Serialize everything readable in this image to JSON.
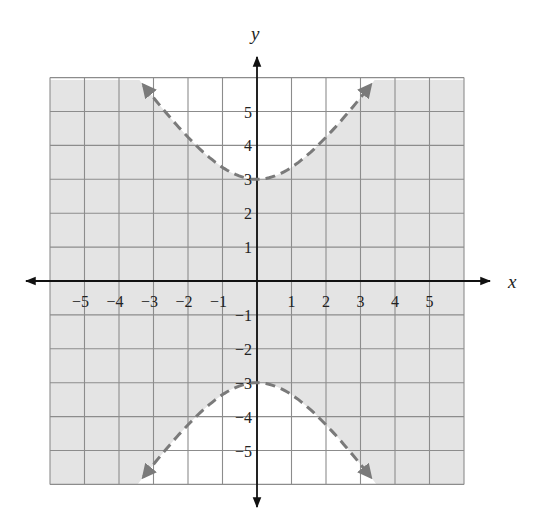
{
  "chart_data": {
    "type": "line",
    "title": "",
    "xlabel": "x",
    "ylabel": "y",
    "xlim": [
      -6,
      6
    ],
    "ylim": [
      -6,
      6
    ],
    "grid": true,
    "x_tick_labels": [
      "−5",
      "−4",
      "−3",
      "−2",
      "−1",
      "1",
      "2",
      "3",
      "4",
      "5"
    ],
    "x_ticks": [
      -5,
      -4,
      -3,
      -2,
      -1,
      1,
      2,
      3,
      4,
      5
    ],
    "y_tick_labels": [
      "5",
      "4",
      "3",
      "2",
      "1",
      "−1",
      "−2",
      "−3",
      "−4",
      "−5"
    ],
    "y_ticks": [
      5,
      4,
      3,
      2,
      1,
      -1,
      -2,
      -3,
      -4,
      -5
    ],
    "boundary": {
      "equation": "y^2/9 - x^2/4 = 1",
      "style": "dashed",
      "vertices": [
        [
          0,
          3
        ],
        [
          0,
          -3
        ]
      ],
      "a": 3,
      "b": 2,
      "series": [
        {
          "name": "upper branch",
          "x": [
            -3.46,
            -3,
            -2,
            -1,
            0,
            1,
            2,
            3,
            3.46
          ],
          "y": [
            6,
            5.41,
            4.24,
            3.35,
            3,
            3.35,
            4.24,
            5.41,
            6
          ]
        },
        {
          "name": "lower branch",
          "x": [
            -3.46,
            -3,
            -2,
            -1,
            0,
            1,
            2,
            3,
            3.46
          ],
          "y": [
            -6,
            -5.41,
            -4.24,
            -3.35,
            -3,
            -3.35,
            -4.24,
            -5.41,
            -6
          ]
        }
      ]
    },
    "shaded_region": "between branches (y^2/9 - x^2/4 < 1)",
    "colors": {
      "shade": "#e4e4e4",
      "grid": "#8c8c8c",
      "curve": "#7a7a7a",
      "axis": "#111111"
    }
  }
}
